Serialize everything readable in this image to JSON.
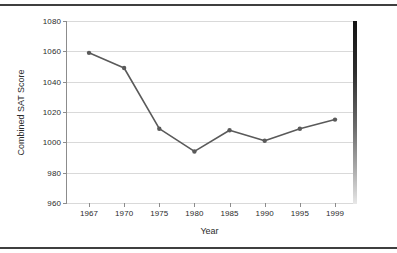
{
  "chart_data": {
    "type": "line",
    "title": "",
    "xlabel": "Year",
    "ylabel": "Combined SAT Score",
    "x": [
      1967,
      1970,
      1975,
      1980,
      1985,
      1990,
      1995,
      1999
    ],
    "categories": [
      "1967",
      "1970",
      "1975",
      "1980",
      "1985",
      "1990",
      "1995",
      "1999"
    ],
    "values": [
      1059,
      1049,
      1009,
      994,
      1008,
      1001,
      1009,
      1015
    ],
    "series": [
      {
        "name": "Combined SAT Score",
        "values": [
          1059,
          1049,
          1009,
          994,
          1008,
          1001,
          1009,
          1015
        ]
      }
    ],
    "xtick_labels": [
      "1967",
      "1970",
      "1975",
      "1980",
      "1985",
      "1990",
      "1995",
      "1999"
    ],
    "ytick_labels": [
      "960",
      "980",
      "1000",
      "1020",
      "1040",
      "1060",
      "1080"
    ],
    "ytick_values": [
      960,
      980,
      1000,
      1020,
      1040,
      1060,
      1080
    ],
    "ylim": [
      960,
      1080
    ],
    "grid": "horizontal",
    "legend": "none",
    "line_color": "#5a5a5a",
    "marker": "circle",
    "marker_color": "#5a5a5a",
    "gridline_color": "#d9d9d9",
    "axis_color": "#8c8c8c",
    "plot_background": "#ffffff",
    "shadow_color": "#141414"
  }
}
